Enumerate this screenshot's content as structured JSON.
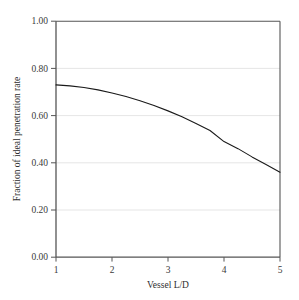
{
  "chart_data": {
    "type": "line",
    "title": "",
    "subtitle": "",
    "xlabel": "Vessel L/D",
    "ylabel": "Fraction of ideal penetration rate",
    "xlim": [
      1,
      5
    ],
    "ylim": [
      0.0,
      1.0
    ],
    "xticks": [
      1,
      2,
      3,
      4,
      5
    ],
    "xtick_labels": [
      "1",
      "2",
      "3",
      "4",
      "5"
    ],
    "yticks": [
      0.0,
      0.2,
      0.4,
      0.6,
      0.8,
      1.0
    ],
    "ytick_labels": [
      "0.00",
      "0.20",
      "0.40",
      "0.60",
      "0.80",
      "1.00"
    ],
    "grid": "horizontal",
    "legend": "none",
    "series": [
      {
        "name": "Fraction of ideal penetration rate",
        "color": "#1a1a1a",
        "x": [
          1.0,
          1.25,
          1.5,
          1.75,
          2.0,
          2.25,
          2.5,
          2.75,
          3.0,
          3.25,
          3.5,
          3.75,
          4.0,
          4.25,
          4.5,
          4.75,
          5.0
        ],
        "values": [
          0.73,
          0.726,
          0.719,
          0.709,
          0.696,
          0.681,
          0.663,
          0.643,
          0.62,
          0.595,
          0.567,
          0.537,
          0.49,
          0.46,
          0.425,
          0.393,
          0.36
        ]
      }
    ],
    "annotations": []
  },
  "axes": {
    "x_tick_labels": [
      "1",
      "2",
      "3",
      "4",
      "5"
    ],
    "y_tick_labels": [
      "0.00",
      "0.20",
      "0.40",
      "0.60",
      "0.80",
      "1.00"
    ],
    "x_axis_title": "Vessel L/D",
    "y_axis_title": "Fraction of ideal penetration rate"
  },
  "colors": {
    "background": "#ffffff",
    "axis": "#4a4a4a",
    "grid": "#dcdcdc",
    "curve": "#1a1a1a",
    "text": "#2e2e2e"
  }
}
